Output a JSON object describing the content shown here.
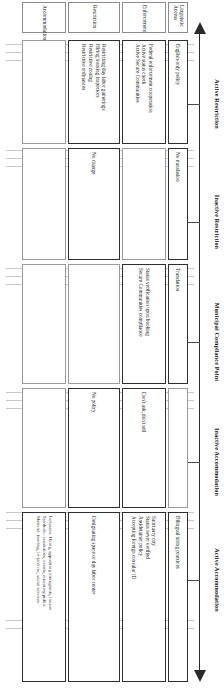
{
  "figure": {
    "axis": {
      "left_arrow": "arrow-left",
      "right_arrow": "arrow-right"
    },
    "columns": [
      {
        "key": "active_restriction",
        "label": "Active Restriction"
      },
      {
        "key": "inactive_restriction",
        "label": "Inactive Restriction"
      },
      {
        "key": "municipal_compliance",
        "label": "Municipal Compliance Point"
      },
      {
        "key": "inactive_accommodation",
        "label": "Inactive Accommodation"
      },
      {
        "key": "active_accommodation",
        "label": "Active Accommodation"
      }
    ],
    "rows": [
      {
        "key": "linguistic_access",
        "label": "Linguistic Access"
      },
      {
        "key": "enforcement",
        "label": "Enforcement"
      },
      {
        "key": "restriction",
        "label": "Restriction"
      },
      {
        "key": "accommodation",
        "label": "Accommodation"
      }
    ],
    "cells": {
      "linguistic_access": {
        "active_restriction": [
          "English-only policy"
        ],
        "inactive_restriction": [
          "No translation"
        ],
        "municipal_compliance": [
          "Translation"
        ],
        "inactive_accommodation": [],
        "active_accommodation": [
          "Bilingual hiring practices"
        ]
      },
      "enforcement": {
        "active_restriction": [
          "Federal enforcement cooperation",
          "Active status check",
          "Active Secure Communities"
        ],
        "inactive_restriction": [],
        "municipal_compliance": [
          "Status verification upon booking",
          "Secure Communities compliance"
        ],
        "inactive_accommodation": [
          "Don't ask, don't tell"
        ],
        "active_accommodation": [
          "Sanctuary city",
          "Status never verified",
          "Antidetainer policy",
          "Accepting foreign consular ID"
        ]
      },
      "restriction": {
        "active_restriction": [
          "Restricting day labor gatherings",
          "Hiring housing inspectors",
          "Restrictive zoning",
          "Restrictive ordinances"
        ],
        "inactive_restriction": [
          "No change"
        ],
        "municipal_compliance": [],
        "inactive_accommodation": [
          "No policy"
        ],
        "active_accommodation": [
          "Designating space or day labor center"
        ]
      },
      "accommodation": {
        "active_restriction": [],
        "inactive_restriction": [],
        "municipal_compliance": [],
        "inactive_accommodation": [],
        "active_accommodation": [
          "Inclusion: Hiring, appointing immigrants, liaison",
          "Symbolic: resolutions, events, educating public",
          "Material: funding, in-kind rsc, social services"
        ]
      }
    }
  }
}
